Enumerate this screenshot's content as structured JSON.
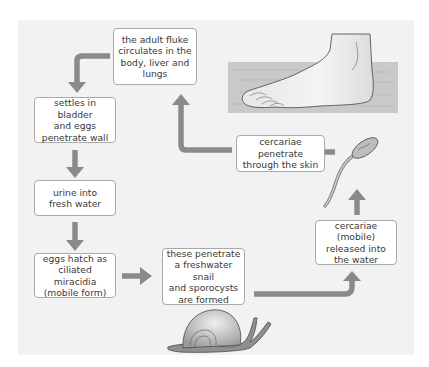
{
  "diagram": {
    "type": "life-cycle flow",
    "colors": {
      "background_panel": "#f2f2f2",
      "box_fill": "#ffffff",
      "box_border": "#a9a9a9",
      "arrow": "#8a8a8a",
      "text": "#3a3a3a"
    },
    "steps": [
      {
        "id": "adult-fluke",
        "label": "the adult fluke\ncirculates in the\nbody, liver and\nlungs"
      },
      {
        "id": "settles",
        "label": "settles in bladder\nand eggs\npenetrate wall"
      },
      {
        "id": "urine",
        "label": "urine into\nfresh water"
      },
      {
        "id": "eggs-hatch",
        "label": "eggs hatch as\nciliated miracidia\n(mobile form)"
      },
      {
        "id": "snail",
        "label": "these penetrate\na freshwater snail\nand sporocysts\nare formed"
      },
      {
        "id": "cercariae-released",
        "label": "cercariae (mobile)\nreleased into\nthe water"
      },
      {
        "id": "cercariae-penetrate",
        "label": "cercariae penetrate\nthrough the skin"
      }
    ],
    "illustrations": [
      "foot-in-water",
      "cercaria",
      "snail"
    ]
  }
}
